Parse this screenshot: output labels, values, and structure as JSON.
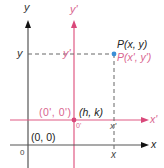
{
  "diagram": {
    "colors": {
      "original_axes": "#222222",
      "translated_axes": "#e05a84",
      "translated_text": "#d9658f",
      "point": "#3a8fd6",
      "dashed": "#666666"
    },
    "original_axes": {
      "x_label": "x",
      "y_label": "y",
      "origin_label": "(0, 0)",
      "origin_tick": "0"
    },
    "translated_axes": {
      "x_label": "x'",
      "y_label": "y'",
      "origin_label": "(0', 0')",
      "origin_coords": "(h, k)",
      "origin_tick": "0'"
    },
    "point": {
      "label_original": "P(x, y)",
      "label_translated": "P(x', y')",
      "x_tick_original": "x",
      "x_tick_translated": "x'",
      "y_tick_original": "y",
      "y_tick_translated": "y'"
    }
  }
}
